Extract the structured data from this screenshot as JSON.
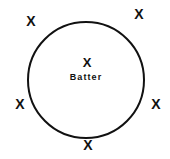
{
  "diagram": {
    "background_color": "#ffffff",
    "ink_color": "#111111",
    "circle": {
      "name": "fielding-circle",
      "center_x": 86,
      "center_y": 80,
      "radius": 58,
      "stroke_width": 2,
      "fill": "none"
    },
    "center_mark": {
      "glyph": "X",
      "label": "Batter",
      "x": 87,
      "y": 62,
      "label_x": 86,
      "label_y": 77
    },
    "perimeter_marks": [
      {
        "glyph": "X",
        "position": "top-left",
        "x": 31,
        "y": 21
      },
      {
        "glyph": "X",
        "position": "top-right",
        "x": 139,
        "y": 14
      },
      {
        "glyph": "X",
        "position": "left",
        "x": 20,
        "y": 104
      },
      {
        "glyph": "X",
        "position": "right",
        "x": 156,
        "y": 104
      },
      {
        "glyph": "X",
        "position": "bottom",
        "x": 88,
        "y": 145
      }
    ]
  },
  "chart_data": {
    "type": "scatter",
    "xlabel": "",
    "ylabel": "",
    "xlim": [
      0,
      170
    ],
    "ylim": [
      0,
      159
    ],
    "grid": false,
    "legend": "none",
    "annotations": [
      "X",
      "Batter"
    ],
    "shapes": [
      {
        "kind": "circle",
        "cx": 86,
        "cy": 80,
        "r": 58,
        "stroke": "#111111",
        "fill": "none"
      }
    ],
    "series": [
      {
        "name": "Batter",
        "marker": "X",
        "points": [
          {
            "x": 87,
            "y": 62,
            "label": "Batter"
          }
        ]
      },
      {
        "name": "Fielders",
        "marker": "X",
        "points": [
          {
            "x": 31,
            "y": 21,
            "label": "top-left"
          },
          {
            "x": 139,
            "y": 14,
            "label": "top-right"
          },
          {
            "x": 20,
            "y": 104,
            "label": "left"
          },
          {
            "x": 156,
            "y": 104,
            "label": "right"
          },
          {
            "x": 88,
            "y": 145,
            "label": "bottom"
          }
        ]
      }
    ]
  }
}
